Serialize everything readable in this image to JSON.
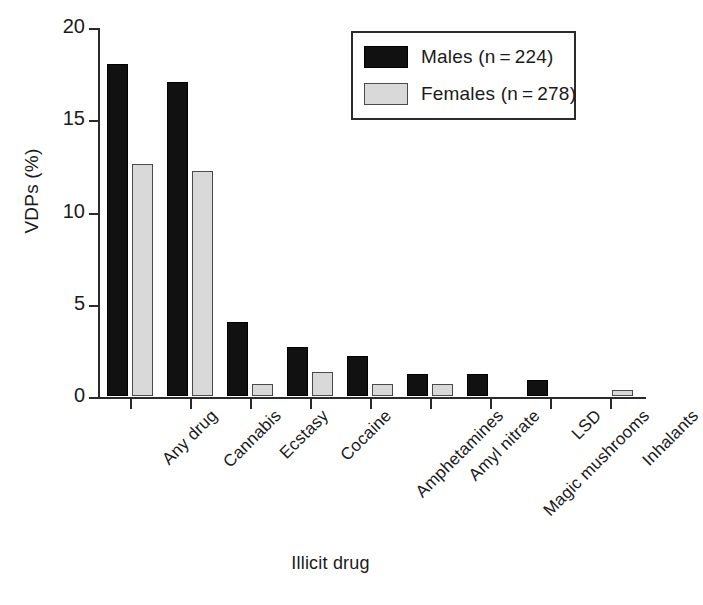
{
  "chart_data": {
    "type": "bar",
    "title": "",
    "xlabel": "Illicit drug",
    "ylabel": "VDPs (%)",
    "ylim": [
      0,
      20
    ],
    "yticks": [
      0,
      5,
      10,
      15,
      20
    ],
    "ytick_labels": [
      "0",
      "5",
      "10",
      "15",
      "20"
    ],
    "grid": false,
    "legend_position": "top-right",
    "categories": [
      "Any drug",
      "Cannabis",
      "Ecstasy",
      "Cocaine",
      "Amphetamines",
      "Amyl nitrate",
      "Magic mushrooms",
      "LSD",
      "Inhalants"
    ],
    "series": [
      {
        "name": "Males (n = 224)",
        "short_name": "Males",
        "n": 224,
        "color": "#111111",
        "values": [
          18.0,
          17.0,
          4.0,
          2.65,
          2.15,
          1.2,
          1.2,
          0.85,
          0
        ]
      },
      {
        "name": "Females (n = 278)",
        "short_name": "Females",
        "n": 278,
        "color": "#d9d9d9",
        "values": [
          12.6,
          12.2,
          0.65,
          1.3,
          0.65,
          0.65,
          0,
          0,
          0.3
        ]
      }
    ]
  },
  "legend": {
    "items": [
      {
        "label": "Males (n = 224)",
        "swatch": "male"
      },
      {
        "label": "Females (n = 278)",
        "swatch": "female"
      }
    ]
  },
  "axes": {
    "y_label": "VDPs (%)",
    "x_label": "Illicit drug"
  }
}
